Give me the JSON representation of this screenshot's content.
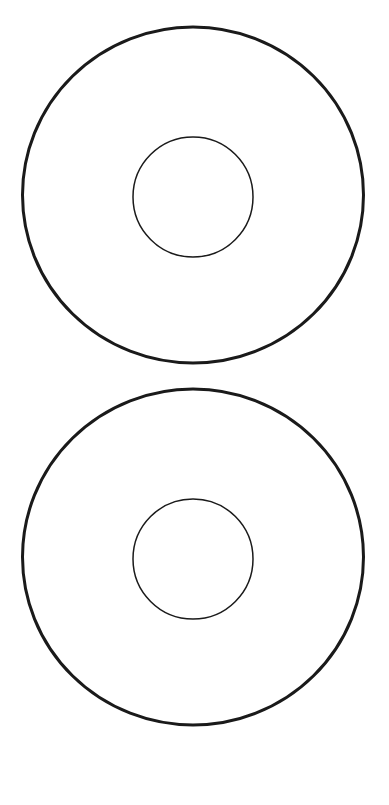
{
  "diagram": {
    "background": "#ffffff",
    "stroke_color": "#1a1a1a",
    "rings": [
      {
        "name": "disc-template-1",
        "center": [
          193,
          195
        ],
        "outer_rx": 170.5,
        "outer_ry": 168,
        "outer_stroke": 3,
        "inner_r": 60,
        "inner_stroke": 1.5
      },
      {
        "name": "disc-template-2",
        "center": [
          193,
          557
        ],
        "outer_rx": 170.5,
        "outer_ry": 168,
        "outer_stroke": 3,
        "inner_r": 60,
        "inner_stroke": 1.5
      }
    ]
  }
}
